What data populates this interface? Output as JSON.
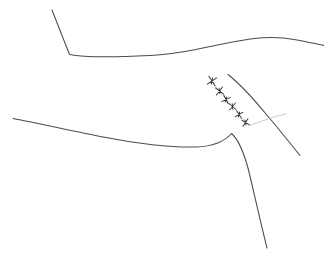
{
  "figure": {
    "width": 324,
    "height": 253,
    "background_color": "#ffffff"
  },
  "palette": {
    "stroke_main": "#4a4a52",
    "stroke_faint": "#b9b9c0",
    "marker_stroke": "#3b2f3a",
    "marker_link": "#c9b9c4"
  },
  "strokes": [
    {
      "name": "upper-ridge-line",
      "description": "Descending segment from upper left to a sharp corner, then a long shallow ridge running right with a crest",
      "color": "#4a4a52",
      "width": 1.05,
      "path": "M 52 10 L 69.5 54.5 C 84 57.5 120 57 150 55.5 C 172 54.5 186 51.5 196 49.5 C 214 46 232 41.5 252 38.8 C 268 36.8 282 37.2 294 39.4 C 306 41.6 316 43.8 324 45.4"
    },
    {
      "name": "lower-bank-curve",
      "description": "Long shallow curve sweeping from the left edge down to a corner on the right",
      "color": "#4a4a52",
      "width": 1.05,
      "path": "M 13 118.5 C 40 123.5 72 131 106 137.5 C 140 144 170 147.5 196 147 C 212 146.5 224 142 231.5 133.5"
    },
    {
      "name": "descending-branch-line",
      "description": "Line turning sharply downward from the lower corner to the bottom edge",
      "color": "#4a4a52",
      "width": 1.05,
      "path": "M 231.5 133.5 C 238 139 243 150 248 168 C 253 188 259 216 267 248"
    },
    {
      "name": "right-arc-line",
      "description": "Arc sweeping from upper middle down toward the lower right",
      "color": "#4a4a52",
      "width": 1.05,
      "path": "M 228 74.5 C 240 84 252 97 266 114 C 278 128 290 143 300 155.5"
    },
    {
      "name": "faint-whisker-line",
      "description": "Short faint line rising to meet the right arc",
      "color": "#b9b9c0",
      "width": 0.75,
      "path": "M 249.5 125.5 C 258 122.5 268 119 276 116.5 C 281 115 284 114.4 286.5 114"
    }
  ],
  "marker_chain": {
    "name": "x-marker-chain",
    "description": "A descending diagonal chain of small x-shaped marks joined by a faint connector",
    "count": 6,
    "glyph": "x-mark",
    "glyph_color": "#3b2f3a",
    "link_color": "#c9b9c4",
    "link_path": "M 212 81 L 219 91 L 226 99 L 232.5 106 L 239 114 L 245.5 122",
    "points": [
      {
        "x": 212,
        "y": 81,
        "size": 4.0,
        "rotation": 12
      },
      {
        "x": 219.5,
        "y": 91,
        "size": 3.6,
        "rotation": -8
      },
      {
        "x": 226,
        "y": 99.5,
        "size": 3.4,
        "rotation": 18
      },
      {
        "x": 232.5,
        "y": 106.5,
        "size": 3.4,
        "rotation": -5
      },
      {
        "x": 239,
        "y": 114.5,
        "size": 3.2,
        "rotation": 14
      },
      {
        "x": 245.5,
        "y": 122.5,
        "size": 3.2,
        "rotation": -12
      }
    ]
  }
}
